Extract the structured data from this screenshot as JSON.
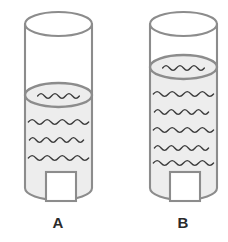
{
  "figure": {
    "background_color": "#ffffff",
    "outline_color": "#8c8c8c",
    "water_fill_color": "#ededed",
    "wave_color": "#3a3a3a",
    "label_color": "#2b2b2b",
    "label_box_fill": "#ffffff"
  },
  "containers": [
    {
      "id": "A",
      "label": "A",
      "shape": "cylinder",
      "left": 25,
      "right": 92,
      "top": 12,
      "bottom": 200,
      "ellipse_ry": 12,
      "water_surface_y": 95,
      "water_level_description": "lower",
      "surface_wave_count": 1,
      "body_wave_count": 3,
      "body_wave_y": [
        122,
        140,
        158
      ],
      "label_box": {
        "x": 46,
        "y": 172,
        "w": 30,
        "h": 29
      },
      "label_x": 58,
      "label_y": 228
    },
    {
      "id": "B",
      "label": "B",
      "shape": "cylinder",
      "left": 150,
      "right": 217,
      "top": 12,
      "bottom": 200,
      "ellipse_ry": 12,
      "water_surface_y": 67,
      "water_level_description": "higher",
      "surface_wave_count": 1,
      "body_wave_count": 5,
      "body_wave_y": [
        94,
        112,
        130,
        148,
        163
      ],
      "label_box": {
        "x": 170,
        "y": 172,
        "w": 30,
        "h": 29
      },
      "label_x": 183,
      "label_y": 228
    }
  ]
}
